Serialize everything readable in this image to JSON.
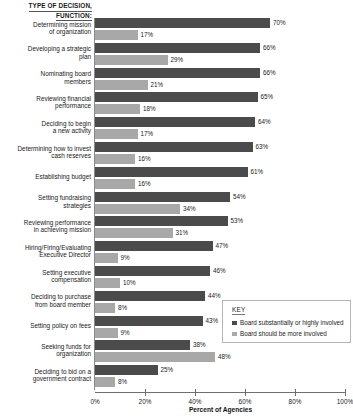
{
  "header": {
    "line1": "TYPE OF DECISION,",
    "line2": "FUNCTION:"
  },
  "legend": {
    "title": "KEY",
    "entries": [
      {
        "label": "Board substantially or highly involved",
        "color": "#4b4b4b"
      },
      {
        "label": "Board should be more involved",
        "color": "#a8a8a8"
      }
    ]
  },
  "colors": {
    "dark": "#4b4b4b",
    "light": "#a8a8a8",
    "axis": "#6f6f6f"
  },
  "chart_data": {
    "type": "bar",
    "orientation": "horizontal",
    "title": "TYPE OF DECISION, FUNCTION:",
    "xlabel": "Percent of Agencies",
    "ylabel": "",
    "xlim": [
      0,
      100
    ],
    "grid": false,
    "legend_position": "bottom-right",
    "tick_labels": [
      "0%",
      "20%",
      "40%",
      "60%",
      "80%",
      "100%"
    ],
    "ticks": [
      0,
      20,
      40,
      60,
      80,
      100
    ],
    "categories": [
      "Determining mission of organization",
      "Developing a strategic plan",
      "Nominating board members",
      "Reviewing financial performance",
      "Deciding to begin a new activity",
      "Determining how to invest cash reserves",
      "Establishing budget",
      "Setting fundraising strategies",
      "Reviewing performance in achieving mission",
      "Hiring/Firing/Evaluating Executive Director",
      "Setting executive compensation",
      "Deciding to purchase from board member",
      "Setting policy on fees",
      "Seeking funds for organization",
      "Deciding to bid on a government contract"
    ],
    "category_lines": [
      [
        "Determining mission",
        "of organization"
      ],
      [
        "Developing a strategic",
        "plan"
      ],
      [
        "Nominating board",
        "members"
      ],
      [
        "Reviewing financial",
        "performance"
      ],
      [
        "Deciding to begin",
        "a new activity"
      ],
      [
        "Determining how to invest",
        "cash reserves"
      ],
      [
        "Establishing budget"
      ],
      [
        "Setting fundraising",
        "strategies"
      ],
      [
        "Reviewing performance",
        "in achieving mission"
      ],
      [
        "Hiring/Firing/Evaluating",
        "Executive Director"
      ],
      [
        "Setting executive",
        "compensation"
      ],
      [
        "Deciding to purchase",
        "from board member"
      ],
      [
        "Setting policy on fees"
      ],
      [
        "Seeking funds for",
        "organization"
      ],
      [
        "Deciding to bid on a",
        "government contract"
      ]
    ],
    "series": [
      {
        "name": "Board substantially or highly involved",
        "color": "#4b4b4b",
        "values": [
          70,
          66,
          66,
          65,
          64,
          63,
          61,
          54,
          53,
          47,
          46,
          44,
          43,
          38,
          25
        ],
        "labels": [
          "70%",
          "66%",
          "66%",
          "65%",
          "64%",
          "63%",
          "61%",
          "54%",
          "53%",
          "47%",
          "46%",
          "44%",
          "43%",
          "38%",
          "25%"
        ]
      },
      {
        "name": "Board should be more involved",
        "color": "#a8a8a8",
        "values": [
          17,
          29,
          21,
          18,
          17,
          16,
          16,
          34,
          31,
          9,
          10,
          8,
          9,
          48,
          8
        ],
        "labels": [
          "17%",
          "29%",
          "21%",
          "18%",
          "17%",
          "16%",
          "16%",
          "34%",
          "31%",
          "9%",
          "10%",
          "8%",
          "9%",
          "48%",
          "8%"
        ]
      }
    ]
  }
}
